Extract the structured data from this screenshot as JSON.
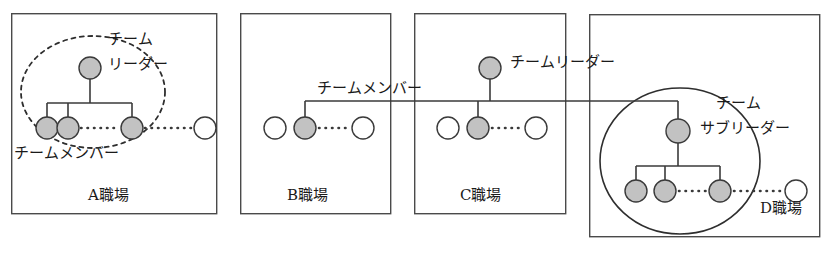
{
  "diagram": {
    "title_text_present": false,
    "colors": {
      "node_filled": "#c0c0c0",
      "node_empty": "#ffffff",
      "stroke": "#3a3a3a",
      "text": "#1a1a1a",
      "background": "#ffffff"
    },
    "workplaces": [
      {
        "id": "A",
        "label": "A職場",
        "box": {
          "x": 11,
          "y": 13,
          "w": 206,
          "h": 201
        },
        "label_pos": {
          "x": 88,
          "y": 196
        },
        "grouping": {
          "shape": "ellipse",
          "style": "dashed",
          "cx": 93,
          "cy": 92,
          "rx": 72,
          "ry": 56
        },
        "annotations": [
          {
            "name": "team-leader",
            "lines": [
              "チーム",
              "リーダー"
            ],
            "x": 108,
            "y": 39
          },
          {
            "name": "team-member",
            "lines": [
              "チームメンバー"
            ],
            "x": 16,
            "y": 152
          }
        ],
        "leader_node": {
          "cx": 90,
          "cy": 68,
          "r": 11,
          "fill": "filled"
        },
        "member_nodes": [
          {
            "cx": 47,
            "cy": 128,
            "r": 11,
            "fill": "filled"
          },
          {
            "cx": 68,
            "cy": 128,
            "r": 11,
            "fill": "filled"
          },
          {
            "cx": 132,
            "cy": 128,
            "r": 11,
            "fill": "filled"
          },
          {
            "cx": 205,
            "cy": 128,
            "r": 11,
            "fill": "empty"
          }
        ],
        "connector_bar_y": 103,
        "dotted_runs": [
          {
            "x1": 80,
            "x2": 120,
            "y": 128
          },
          {
            "x1": 144,
            "x2": 193,
            "y": 128
          }
        ]
      },
      {
        "id": "B",
        "label": "B職場",
        "box": {
          "x": 240,
          "y": 13,
          "w": 151,
          "h": 201
        },
        "label_pos": {
          "x": 287,
          "y": 196
        },
        "grouping": null,
        "annotations": [
          {
            "name": "team-member",
            "lines": [
              "チームメンバー"
            ],
            "x": 317,
            "y": 80
          }
        ],
        "leader_node": null,
        "member_nodes": [
          {
            "cx": 275,
            "cy": 128,
            "r": 11,
            "fill": "empty"
          },
          {
            "cx": 305,
            "cy": 128,
            "r": 11,
            "fill": "filled"
          },
          {
            "cx": 363,
            "cy": 128,
            "r": 11,
            "fill": "empty"
          }
        ],
        "connector_bar_y": 101,
        "dotted_runs": [
          {
            "x1": 318,
            "x2": 351,
            "y": 128
          }
        ]
      },
      {
        "id": "C",
        "label": "C職場",
        "box": {
          "x": 414,
          "y": 13,
          "w": 152,
          "h": 201
        },
        "label_pos": {
          "x": 460,
          "y": 196
        },
        "grouping": null,
        "annotations": [
          {
            "name": "team-leader",
            "lines": [
              "チームリーダー"
            ],
            "x": 510,
            "y": 53
          }
        ],
        "leader_node": {
          "cx": 490,
          "cy": 68,
          "r": 11,
          "fill": "filled"
        },
        "member_nodes": [
          {
            "cx": 448,
            "cy": 128,
            "r": 11,
            "fill": "empty"
          },
          {
            "cx": 478,
            "cy": 128,
            "r": 11,
            "fill": "filled"
          },
          {
            "cx": 536,
            "cy": 128,
            "r": 11,
            "fill": "empty"
          }
        ],
        "connector_bar_y": 101,
        "dotted_runs": [
          {
            "x1": 491,
            "x2": 524,
            "y": 128
          }
        ]
      },
      {
        "id": "D",
        "label": "D職場",
        "box": {
          "x": 589,
          "y": 14,
          "w": 231,
          "h": 223
        },
        "label_pos": {
          "x": 762,
          "y": 209
        },
        "grouping": {
          "shape": "ellipse",
          "style": "solid",
          "cx": 680,
          "cy": 161,
          "rx": 80,
          "ry": 73
        },
        "annotations": [
          {
            "name": "team-subleader",
            "lines": [
              "チーム",
              "サブリーダー"
            ],
            "x": 716,
            "y": 106
          }
        ],
        "leader_node": {
          "cx": 678,
          "cy": 131,
          "r": 12,
          "fill": "filled"
        },
        "member_nodes": [
          {
            "cx": 636,
            "cy": 191,
            "r": 11,
            "fill": "filled"
          },
          {
            "cx": 665,
            "cy": 191,
            "r": 11,
            "fill": "filled"
          },
          {
            "cx": 720,
            "cy": 191,
            "r": 11,
            "fill": "filled"
          },
          {
            "cx": 796,
            "cy": 191,
            "r": 11,
            "fill": "empty"
          }
        ],
        "connector_bar_y": 166,
        "dotted_runs": [
          {
            "x1": 678,
            "x2": 708,
            "y": 191
          },
          {
            "x1": 733,
            "x2": 783,
            "y": 191
          }
        ]
      }
    ],
    "inter_workplace_link": {
      "name": "team-member-link",
      "y": 101,
      "x_start": 305,
      "x_end": 678,
      "description": "horizontal line connecting B member, C leader and D sub-leader"
    }
  }
}
